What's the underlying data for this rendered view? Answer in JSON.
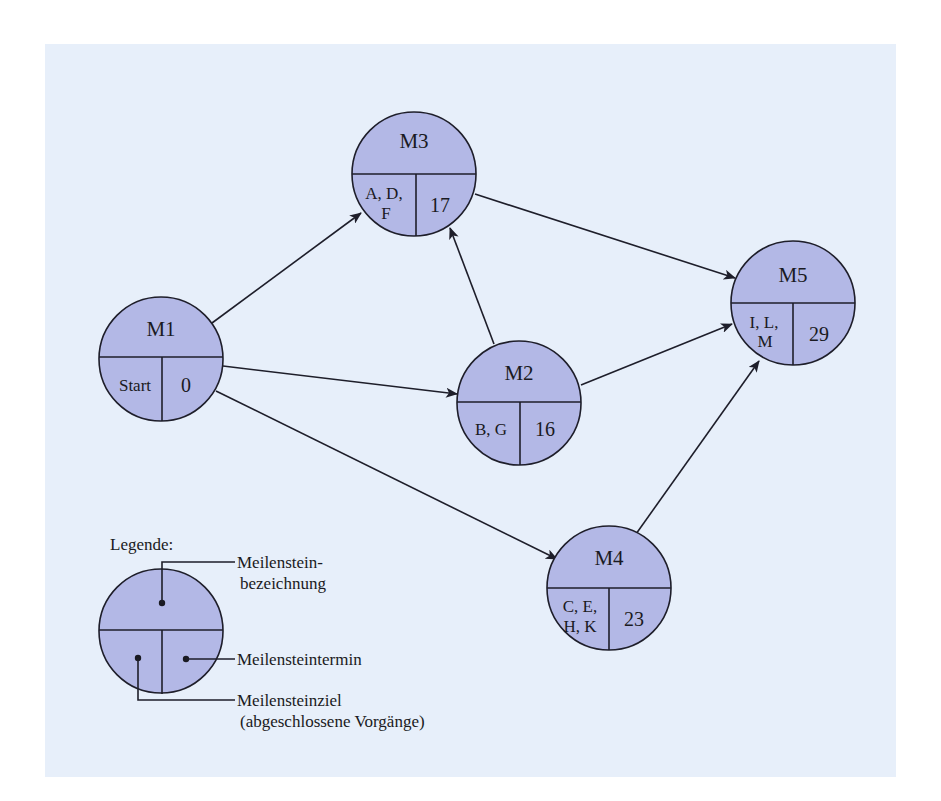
{
  "diagram": {
    "type": "milestone-network",
    "background_color": "#e7effa",
    "node_fill_color": "#b3b8e6",
    "stroke_color": "#1e1e2a",
    "nodes": [
      {
        "id": "M1",
        "title": "M1",
        "activities": [
          "Start"
        ],
        "date": "0"
      },
      {
        "id": "M2",
        "title": "M2",
        "activities": [
          "B, G"
        ],
        "date": "16"
      },
      {
        "id": "M3",
        "title": "M3",
        "activities": [
          "A, D,",
          "F"
        ],
        "date": "17"
      },
      {
        "id": "M4",
        "title": "M4",
        "activities": [
          "C, E,",
          "H, K"
        ],
        "date": "23"
      },
      {
        "id": "M5",
        "title": "M5",
        "activities": [
          "I, L,",
          "M"
        ],
        "date": "29"
      }
    ],
    "edges": [
      {
        "from": "M1",
        "to": "M3"
      },
      {
        "from": "M1",
        "to": "M2"
      },
      {
        "from": "M1",
        "to": "M4"
      },
      {
        "from": "M2",
        "to": "M3"
      },
      {
        "from": "M2",
        "to": "M5"
      },
      {
        "from": "M3",
        "to": "M5"
      },
      {
        "from": "M4",
        "to": "M5"
      }
    ]
  },
  "nodes": {
    "m1": {
      "title": "M1",
      "left": "Start",
      "right": "0"
    },
    "m2": {
      "title": "M2",
      "left": "B, G",
      "right": "16"
    },
    "m3": {
      "title": "M3",
      "left_line1": "A, D,",
      "left_line2": "F",
      "right": "17"
    },
    "m4": {
      "title": "M4",
      "left_line1": "C, E,",
      "left_line2": "H, K",
      "right": "23"
    },
    "m5": {
      "title": "M5",
      "left_line1": "I, L,",
      "left_line2": "M",
      "right": "29"
    }
  },
  "legend": {
    "heading": "Legende:",
    "name_line1": "Meilenstein-",
    "name_line2": "bezeichnung",
    "date": "Meilensteintermin",
    "goal_line1": "Meilensteinziel",
    "goal_line2": "(abgeschlossene Vorgänge)"
  }
}
